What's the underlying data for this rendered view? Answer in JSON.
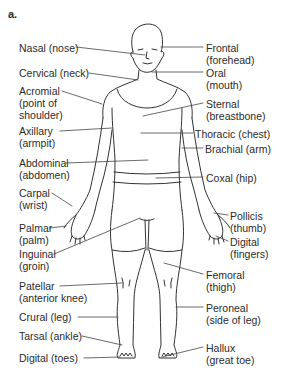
{
  "figure": {
    "panel_label": "a.",
    "left_labels": [
      {
        "term": "Nasal (nose)",
        "x": 19,
        "y": 42
      },
      {
        "term": "Cervical (neck)",
        "x": 19,
        "y": 67
      },
      {
        "term": "Acromial\n(point of\nshoulder)",
        "x": 19,
        "y": 85
      },
      {
        "term": "Axillary\n(armpit)",
        "x": 19,
        "y": 125
      },
      {
        "term": "Abdominal\n(abdomen)",
        "x": 19,
        "y": 157
      },
      {
        "term": "Carpal\n(wrist)",
        "x": 19,
        "y": 187
      },
      {
        "term": "Palmar\n(palm)",
        "x": 19,
        "y": 222
      },
      {
        "term": "Inguinal\n(groin)",
        "x": 19,
        "y": 248
      },
      {
        "term": "Patellar\n(anterior knee)",
        "x": 19,
        "y": 280
      },
      {
        "term": "Crural (leg)",
        "x": 19,
        "y": 311
      },
      {
        "term": "Tarsal (ankle)",
        "x": 19,
        "y": 330
      },
      {
        "term": "Digital (toes)",
        "x": 19,
        "y": 352
      }
    ],
    "right_labels": [
      {
        "term": "Frontal\n(forehead)",
        "x": 206,
        "y": 42
      },
      {
        "term": "Oral\n(mouth)",
        "x": 206,
        "y": 67
      },
      {
        "term": "Sternal\n(breastbone)",
        "x": 206,
        "y": 98
      },
      {
        "term": "Thoracic (chest)",
        "x": 195,
        "y": 129
      },
      {
        "term": "Brachial (arm)",
        "x": 205,
        "y": 143
      },
      {
        "term": "Coxal (hip)",
        "x": 206,
        "y": 172
      },
      {
        "term": "Pollicis\n(thumb)",
        "x": 230,
        "y": 210
      },
      {
        "term": "Digital\n(fingers)",
        "x": 230,
        "y": 236
      },
      {
        "term": "Femoral\n(thigh)",
        "x": 206,
        "y": 269
      },
      {
        "term": "Peroneal\n(side of leg)",
        "x": 206,
        "y": 302
      },
      {
        "term": "Hallux\n(great toe)",
        "x": 206,
        "y": 342
      }
    ]
  },
  "colors": {
    "line": "#333333",
    "text": "#2b2b2b",
    "background": "#ffffff"
  }
}
